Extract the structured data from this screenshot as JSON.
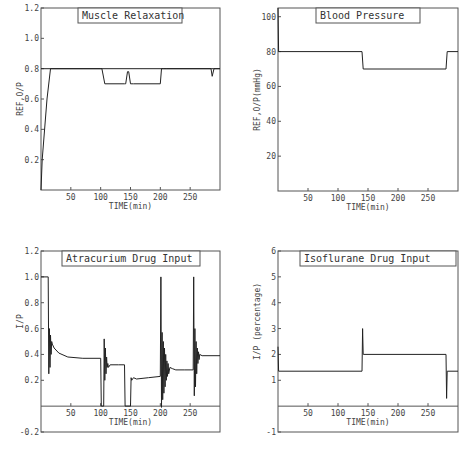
{
  "chart_data": [
    {
      "type": "line",
      "title": "Muscle Relaxation",
      "xlabel": "TIME(min)",
      "ylabel": "REF,O/P",
      "xlim": [
        0,
        300
      ],
      "ylim": [
        0,
        1.2
      ],
      "xticks": [
        50,
        100,
        150,
        200,
        250
      ],
      "yticks": [
        "0.2",
        "0.4",
        "0.6",
        "0.8",
        "1.0",
        "1.2"
      ],
      "series": [
        {
          "name": "REF",
          "x": [
            0,
            300
          ],
          "y": [
            0.8,
            0.8
          ]
        },
        {
          "name": "O/P",
          "x": [
            0,
            2,
            10,
            16,
            100,
            102,
            107,
            140,
            142,
            145,
            147,
            150,
            155,
            200,
            202,
            205,
            210,
            285,
            287,
            290,
            300
          ],
          "y": [
            0.0,
            0.2,
            0.6,
            0.8,
            0.8,
            0.8,
            0.7,
            0.7,
            0.7,
            0.78,
            0.78,
            0.7,
            0.7,
            0.7,
            0.8,
            0.8,
            0.8,
            0.8,
            0.75,
            0.8,
            0.8
          ]
        }
      ]
    },
    {
      "type": "line",
      "title": "Blood Pressure",
      "xlabel": "TIME(min)",
      "ylabel": "REF,O/P(mmHg)",
      "xlim": [
        0,
        300
      ],
      "ylim": [
        0,
        105
      ],
      "xticks": [
        50,
        100,
        150,
        200,
        250
      ],
      "yticks": [
        "20",
        "40",
        "60",
        "80",
        "100"
      ],
      "series": [
        {
          "name": "O/P",
          "x": [
            0,
            1,
            2,
            140,
            142,
            280,
            282,
            300
          ],
          "y": [
            105,
            80,
            80,
            80,
            70,
            70,
            80,
            80
          ]
        }
      ]
    },
    {
      "type": "line",
      "title": "Atracurium Drug Input",
      "xlabel": "TIME(min)",
      "ylabel": "I/P",
      "xlim": [
        0,
        300
      ],
      "ylim": [
        -0.2,
        1.2
      ],
      "xticks": [
        50,
        100,
        150,
        200,
        250
      ],
      "yticks": [
        "-0.2",
        "0.2",
        "0.4",
        "0.6",
        "0.8",
        "1.0",
        "1.2"
      ],
      "series": [
        {
          "name": "I/P",
          "x": [
            0,
            12,
            13,
            14,
            15,
            16,
            17,
            18,
            19,
            22,
            30,
            45,
            70,
            100,
            101,
            105,
            106,
            107,
            108,
            109,
            110,
            111,
            112,
            113,
            116,
            130,
            140,
            141,
            150,
            151,
            152,
            155,
            160,
            180,
            200,
            201,
            202,
            203,
            204,
            205,
            206,
            207,
            208,
            209,
            210,
            211,
            212,
            213,
            214,
            216,
            220,
            226,
            240,
            255,
            256,
            257,
            258,
            259,
            260,
            261,
            262,
            263,
            264,
            265,
            266,
            270,
            300
          ],
          "y": [
            1.0,
            1.0,
            0.25,
            0.6,
            0.3,
            0.55,
            0.4,
            0.5,
            0.48,
            0.45,
            0.41,
            0.38,
            0.37,
            0.37,
            0.0,
            0.0,
            0.52,
            0.2,
            0.45,
            0.25,
            0.38,
            0.3,
            0.33,
            0.3,
            0.32,
            0.32,
            0.32,
            0.0,
            0.0,
            0.22,
            0.2,
            0.22,
            0.21,
            0.22,
            0.23,
            1.0,
            -0.01,
            0.57,
            0.05,
            0.5,
            0.1,
            0.45,
            0.15,
            0.4,
            0.2,
            0.35,
            0.23,
            0.33,
            0.25,
            0.3,
            0.29,
            0.28,
            0.28,
            0.28,
            1.0,
            0.08,
            0.6,
            0.15,
            0.5,
            0.25,
            0.45,
            0.33,
            0.42,
            0.36,
            0.4,
            0.39,
            0.39
          ]
        }
      ]
    },
    {
      "type": "line",
      "title": "Isoflurane Drug Input",
      "xlabel": "TIME(min)",
      "ylabel": "I/P (percentage)",
      "xlim": [
        0,
        300
      ],
      "ylim": [
        -1,
        6
      ],
      "xticks": [
        50,
        100,
        150,
        200,
        250
      ],
      "yticks": [
        "-1",
        "1",
        "2",
        "3",
        "4",
        "5",
        "6"
      ],
      "series": [
        {
          "name": "I/P",
          "x": [
            0,
            1,
            140,
            141,
            142,
            143,
            280,
            281,
            282,
            283,
            300
          ],
          "y": [
            2.3,
            1.35,
            1.35,
            3.0,
            2.0,
            2.0,
            2.0,
            0.3,
            1.35,
            1.35,
            1.35
          ]
        }
      ]
    }
  ]
}
